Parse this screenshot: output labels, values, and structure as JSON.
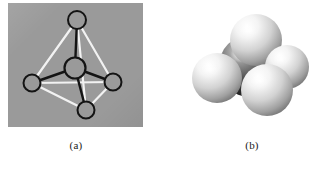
{
  "figure": {
    "background_color": "#ffffff",
    "width": 330,
    "height": 170
  },
  "panels": [
    {
      "id": "a",
      "caption": "(a)",
      "type": "ball-and-stick-model",
      "panel_background_color": "#9a9a9a",
      "panel_rect": {
        "x": 8,
        "y": 3,
        "width": 135,
        "height": 124
      },
      "atoms": [
        {
          "name": "top-vertex-atom",
          "cx": 69,
          "cy": 17,
          "r": 9.0,
          "fill": "#9a9a9a",
          "stroke": "#141414",
          "stroke_width": 2.0
        },
        {
          "name": "center-atom",
          "cx": 67,
          "cy": 65,
          "r": 10.5,
          "fill": "#9a9a9a",
          "stroke": "#141414",
          "stroke_width": 2.2
        },
        {
          "name": "left-vertex-atom",
          "cx": 24,
          "cy": 80,
          "r": 8.5,
          "fill": "#9a9a9a",
          "stroke": "#141414",
          "stroke_width": 2.0
        },
        {
          "name": "right-vertex-atom",
          "cx": 105,
          "cy": 79,
          "r": 8.5,
          "fill": "#9a9a9a",
          "stroke": "#141414",
          "stroke_width": 2.0
        },
        {
          "name": "bottom-vertex-atom",
          "cx": 78,
          "cy": 107,
          "r": 8.5,
          "fill": "#9a9a9a",
          "stroke": "#141414",
          "stroke_width": 2.0
        }
      ],
      "bonds": [
        {
          "name": "bond-center-top",
          "from": "center-atom",
          "to": "top-vertex-atom",
          "color": "#141414",
          "width": 2.4
        },
        {
          "name": "bond-center-left",
          "from": "center-atom",
          "to": "left-vertex-atom",
          "color": "#141414",
          "width": 2.4
        },
        {
          "name": "bond-center-right",
          "from": "center-atom",
          "to": "right-vertex-atom",
          "color": "#141414",
          "width": 2.4
        },
        {
          "name": "bond-center-bottom",
          "from": "center-atom",
          "to": "bottom-vertex-atom",
          "color": "#141414",
          "width": 2.4
        }
      ],
      "tetrahedron_edges": [
        {
          "name": "edge-top-left",
          "from": "top-vertex-atom",
          "to": "left-vertex-atom",
          "color": "#f2f2f2",
          "width": 2.2
        },
        {
          "name": "edge-top-right",
          "from": "top-vertex-atom",
          "to": "right-vertex-atom",
          "color": "#f2f2f2",
          "width": 2.2
        },
        {
          "name": "edge-top-bottom",
          "from": "top-vertex-atom",
          "to": "bottom-vertex-atom",
          "color": "#f2f2f2",
          "width": 2.2
        },
        {
          "name": "edge-left-right",
          "from": "left-vertex-atom",
          "to": "right-vertex-atom",
          "color": "#f2f2f2",
          "width": 2.2
        },
        {
          "name": "edge-left-bottom",
          "from": "left-vertex-atom",
          "to": "bottom-vertex-atom",
          "color": "#f2f2f2",
          "width": 2.2
        },
        {
          "name": "edge-bottom-right",
          "from": "bottom-vertex-atom",
          "to": "right-vertex-atom",
          "color": "#f2f2f2",
          "width": 2.2
        }
      ]
    },
    {
      "id": "b",
      "caption": "(b)",
      "type": "space-filling-model",
      "panel_background_color": "#ffffff",
      "spheres": [
        {
          "name": "central-sphere",
          "cx": 64,
          "cy": 60,
          "r": 31,
          "shade": "dark",
          "base_color": "#4a4a4a",
          "highlight_color": "#c8c8c8"
        },
        {
          "name": "top-sphere",
          "cx": 70,
          "cy": 34,
          "r": 26,
          "shade": "light",
          "base_color": "#8f8f8f",
          "highlight_color": "#ffffff"
        },
        {
          "name": "left-sphere",
          "cx": 31,
          "cy": 72,
          "r": 25,
          "shade": "light",
          "base_color": "#8a8a8a",
          "highlight_color": "#ffffff"
        },
        {
          "name": "right-sphere",
          "cx": 101,
          "cy": 61,
          "r": 22,
          "shade": "light",
          "base_color": "#8a8a8a",
          "highlight_color": "#ffffff"
        },
        {
          "name": "front-bottom-sphere",
          "cx": 81,
          "cy": 84,
          "r": 26,
          "shade": "light",
          "base_color": "#8d8d8d",
          "highlight_color": "#ffffff"
        }
      ]
    }
  ]
}
